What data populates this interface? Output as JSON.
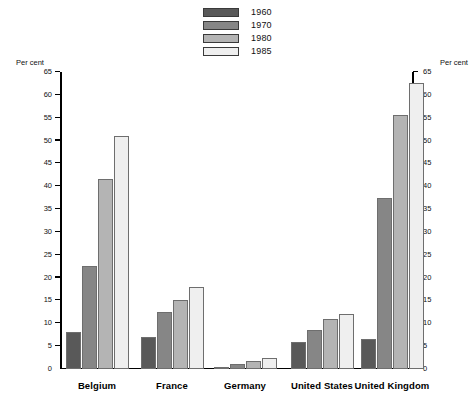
{
  "axis": {
    "left_title": "Per cent",
    "right_title": "Per cent",
    "ticks": [
      "0",
      "5",
      "10",
      "15",
      "20",
      "25",
      "30",
      "35",
      "40",
      "45",
      "50",
      "55",
      "60",
      "65"
    ]
  },
  "legend": {
    "items": [
      {
        "label": "1960",
        "color": "#595959"
      },
      {
        "label": "1970",
        "color": "#868686"
      },
      {
        "label": "1980",
        "color": "#b4b4b4"
      },
      {
        "label": "1985",
        "color": "#efefef"
      }
    ]
  },
  "chart_data": {
    "type": "bar",
    "title": "",
    "subtitle": "",
    "xlabel": "",
    "ylabel": "Per cent",
    "ylim": [
      0,
      65
    ],
    "ytick_step": 5,
    "grid": false,
    "legend_position": "top-center",
    "categories": [
      "Belgium",
      "France",
      "Germany",
      "United States",
      "United Kingdom"
    ],
    "series": [
      {
        "name": "1960",
        "color": "#595959",
        "values": [
          8.0,
          7.0,
          0.4,
          6.0,
          6.5
        ]
      },
      {
        "name": "1970",
        "color": "#868686",
        "values": [
          22.5,
          12.5,
          1.0,
          8.5,
          37.5
        ]
      },
      {
        "name": "1980",
        "color": "#b4b4b4",
        "values": [
          41.5,
          15.0,
          1.8,
          11.0,
          55.5
        ]
      },
      {
        "name": "1985",
        "color": "#efefef",
        "values": [
          51.0,
          18.0,
          2.4,
          12.0,
          62.5
        ]
      }
    ]
  }
}
